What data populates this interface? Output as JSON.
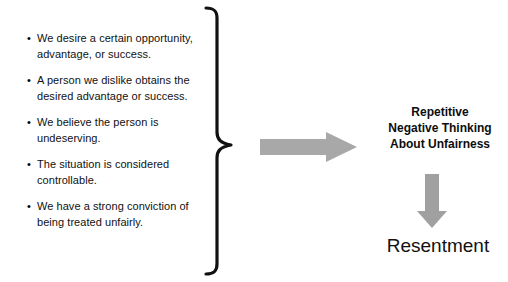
{
  "diagram": {
    "background_color": "#ffffff",
    "text_color": "#111111",
    "arrow_color": "#a8a8a8",
    "brace_color": "#111111",
    "bullet_glyph": "•",
    "conditions": [
      {
        "text": "We desire a certain opportunity, advantage, or success."
      },
      {
        "text": "A person we dislike obtains the desired advantage or success."
      },
      {
        "text": "We believe the person is undeserving."
      },
      {
        "text": "The situation is considered controllable."
      },
      {
        "text": "We have a strong conviction of being treated unfairly."
      }
    ],
    "outcome": {
      "line1": "Repetitive",
      "line2": "Negative Thinking",
      "line3": "About Unfairness"
    },
    "result": "Resentment"
  }
}
